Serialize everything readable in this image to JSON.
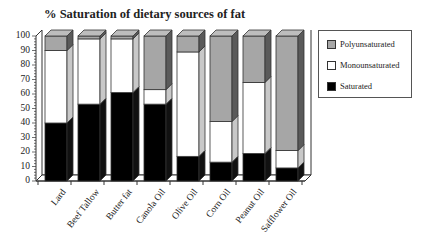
{
  "chart_data": {
    "type": "bar",
    "stacked": true,
    "style": "3d",
    "title": "% Saturation of dietary sources of fat",
    "xlabel": "",
    "ylabel": "",
    "ylim": [
      0,
      100
    ],
    "yticks": [
      0,
      10,
      20,
      30,
      40,
      50,
      60,
      70,
      80,
      90,
      100
    ],
    "grid": false,
    "legend_position": "right",
    "categories": [
      "Lard",
      "Beef Tallow",
      "Butter fat",
      "Canola Oil",
      "Olive Oil",
      "Corn Oil",
      "Peanut Oil",
      "Safflower Oil"
    ],
    "series": [
      {
        "name": "Saturated",
        "color": "#000000",
        "values": [
          40,
          53,
          61,
          53,
          17,
          13,
          19,
          9
        ]
      },
      {
        "name": "Monounsaturated",
        "color": "#ffffff",
        "values": [
          50,
          45,
          37,
          10,
          72,
          28,
          49,
          12
        ]
      },
      {
        "name": "Polyunsaturated",
        "color": "#a6a6a6",
        "values": [
          10,
          2,
          2,
          37,
          11,
          59,
          32,
          79
        ]
      }
    ]
  },
  "legend": {
    "items": [
      {
        "label": "Polyunsaturated",
        "color": "#a6a6a6"
      },
      {
        "label": "Monounsaturated",
        "color": "#ffffff"
      },
      {
        "label": "Saturated",
        "color": "#000000"
      }
    ]
  }
}
